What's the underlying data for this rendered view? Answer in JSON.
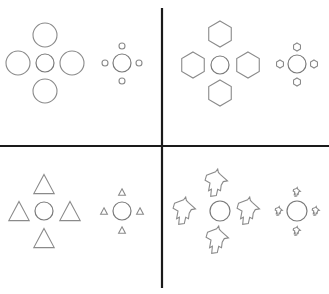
{
  "figure": {
    "title": "",
    "background": "#ffffff",
    "stroke_color": "#8a8a8a",
    "divider_color": "#1a1a1a",
    "dividers": {
      "vertical": {
        "x": 162,
        "y1": 8,
        "y2": 288
      },
      "horizontal": {
        "y": 146,
        "x1": 0,
        "x2": 329
      }
    },
    "quadrants": [
      {
        "name": "circles",
        "inducer_shape": "circle",
        "groups": [
          {
            "size": "large",
            "center": {
              "x": 45,
              "y": 63,
              "r": 9
            },
            "inducer_r": 12,
            "inducers": [
              [
                45,
                35
              ],
              [
                18,
                63
              ],
              [
                72,
                63
              ],
              [
                45,
                91
              ]
            ]
          },
          {
            "size": "small",
            "center": {
              "x": 122,
              "y": 63,
              "r": 9
            },
            "inducer_r": 3,
            "inducers": [
              [
                122,
                46
              ],
              [
                105,
                63
              ],
              [
                139,
                63
              ],
              [
                122,
                81
              ]
            ]
          }
        ]
      },
      {
        "name": "hexagons",
        "inducer_shape": "hexagon",
        "groups": [
          {
            "size": "large",
            "center": {
              "x": 220,
              "y": 65,
              "r": 9
            },
            "inducer_r": 13,
            "inducers": [
              [
                220,
                34
              ],
              [
                193,
                65
              ],
              [
                248,
                65
              ],
              [
                220,
                93
              ]
            ]
          },
          {
            "size": "small",
            "center": {
              "x": 297,
              "y": 64,
              "r": 9
            },
            "inducer_r": 4,
            "inducers": [
              [
                297,
                47
              ],
              [
                280,
                64
              ],
              [
                314,
                64
              ],
              [
                297,
                82
              ]
            ]
          }
        ]
      },
      {
        "name": "triangles",
        "inducer_shape": "triangle",
        "groups": [
          {
            "size": "large",
            "center": {
              "x": 44,
              "y": 211,
              "r": 9
            },
            "inducer_r": 12,
            "inducers": [
              [
                44,
                184
              ],
              [
                19,
                211
              ],
              [
                70,
                211
              ],
              [
                44,
                238
              ]
            ]
          },
          {
            "size": "small",
            "center": {
              "x": 122,
              "y": 211,
              "r": 9
            },
            "inducer_r": 4,
            "inducers": [
              [
                122,
                192
              ],
              [
                104,
                211
              ],
              [
                140,
                211
              ],
              [
                122,
                230
              ]
            ]
          }
        ]
      },
      {
        "name": "irregular-leaves",
        "inducer_shape": "leaf",
        "groups": [
          {
            "size": "large",
            "center": {
              "x": 220,
              "y": 211,
              "r": 10
            },
            "inducer_r": 14,
            "inducers": [
              [
                217,
                183
              ],
              [
                185,
                211
              ],
              [
                249,
                211
              ],
              [
                218,
                240
              ]
            ]
          },
          {
            "size": "small",
            "center": {
              "x": 297,
              "y": 211,
              "r": 10
            },
            "inducer_r": 4.5,
            "inducers": [
              [
                297,
                192
              ],
              [
                279,
                211
              ],
              [
                316,
                211
              ],
              [
                297,
                231
              ]
            ]
          }
        ]
      }
    ]
  }
}
